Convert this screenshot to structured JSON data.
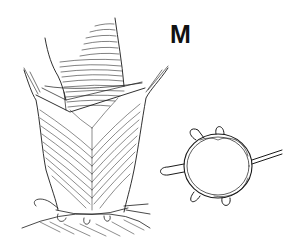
{
  "figure": {
    "panel_label": "M",
    "illustration_left": "surgical-tube-invagination-with-cuff-drawing",
    "illustration_right": "circular-suture-ring-with-loops-drawing",
    "colors": {
      "ink": "#1a1a1a",
      "background": "#ffffff"
    }
  }
}
